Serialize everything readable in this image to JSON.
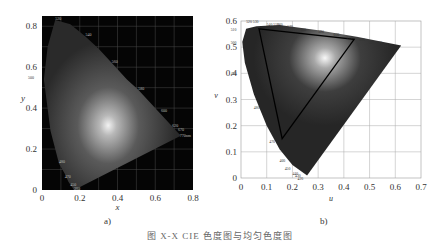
{
  "caption": "图 X-X  CIE 色度图与均匀色度图",
  "chart_data": [
    {
      "type": "scatter",
      "title": "CIE 1931 xy chromaticity diagram",
      "panel_label": "a)",
      "xlabel": "x",
      "ylabel": "y",
      "xlim": [
        0,
        0.8
      ],
      "ylim": [
        0,
        0.85
      ],
      "xticks": [
        "0",
        "0.2",
        "0.4",
        "0.6",
        "0.8"
      ],
      "yticks": [
        "0",
        "0.2",
        "0.4",
        "0.6",
        "0.8"
      ],
      "grid": true,
      "background": "#050505",
      "wavelength_labels": [
        {
          "nm": "520",
          "x": 0.07,
          "y": 0.83
        },
        {
          "nm": "540",
          "x": 0.23,
          "y": 0.75
        },
        {
          "nm": "500",
          "x": 0.01,
          "y": 0.54
        },
        {
          "nm": "560",
          "x": 0.37,
          "y": 0.62
        },
        {
          "nm": "580",
          "x": 0.51,
          "y": 0.49
        },
        {
          "nm": "600",
          "x": 0.63,
          "y": 0.38
        },
        {
          "nm": "620",
          "x": 0.69,
          "y": 0.31
        },
        {
          "nm": "670",
          "x": 0.72,
          "y": 0.29
        },
        {
          "nm": "770nm",
          "x": 0.73,
          "y": 0.26
        },
        {
          "nm": "480",
          "x": 0.09,
          "y": 0.13
        },
        {
          "nm": "470",
          "x": 0.12,
          "y": 0.06
        },
        {
          "nm": "450",
          "x": 0.15,
          "y": 0.02
        },
        {
          "nm": "380",
          "x": 0.17,
          "y": 0.0
        }
      ],
      "locus": [
        [
          0.17,
          0.0
        ],
        [
          0.14,
          0.04
        ],
        [
          0.12,
          0.08
        ],
        [
          0.09,
          0.13
        ],
        [
          0.045,
          0.29
        ],
        [
          0.01,
          0.54
        ],
        [
          0.03,
          0.7
        ],
        [
          0.07,
          0.83
        ],
        [
          0.15,
          0.81
        ],
        [
          0.23,
          0.75
        ],
        [
          0.3,
          0.69
        ],
        [
          0.37,
          0.62
        ],
        [
          0.45,
          0.54
        ],
        [
          0.51,
          0.49
        ],
        [
          0.57,
          0.43
        ],
        [
          0.63,
          0.37
        ],
        [
          0.69,
          0.31
        ],
        [
          0.735,
          0.265
        ]
      ]
    },
    {
      "type": "scatter",
      "title": "CIE 1976 u'v' uniform chromaticity diagram",
      "panel_label": "b)",
      "xlabel": "u",
      "ylabel": "v",
      "xlim": [
        0,
        0.7
      ],
      "ylim": [
        0,
        0.6
      ],
      "xticks": [
        "0",
        "0.1",
        "0.2",
        "0.3",
        "0.4",
        "0.5",
        "0.6",
        "0.7"
      ],
      "yticks": [
        "0",
        "0.1",
        "0.2",
        "0.3",
        "0.4",
        "0.5",
        "0.6"
      ],
      "grid": true,
      "background": "#ffffff",
      "wavelength_labels": [
        {
          "nm": "520 530",
          "u": 0.02,
          "v": 0.6
        },
        {
          "nm": "540 550",
          "u": 0.1,
          "v": 0.59
        },
        {
          "nm": "560",
          "u": 0.14,
          "v": 0.59
        },
        {
          "nm": "570",
          "u": 0.18,
          "v": 0.58
        },
        {
          "nm": "580",
          "u": 0.23,
          "v": 0.57
        },
        {
          "nm": "590",
          "u": 0.3,
          "v": 0.56
        },
        {
          "nm": "600",
          "u": 0.36,
          "v": 0.55
        },
        {
          "nm": "610",
          "u": 0.41,
          "v": 0.54
        },
        {
          "nm": "620",
          "u": 0.46,
          "v": 0.53
        },
        {
          "nm": "630 640",
          "u": 0.5,
          "v": 0.52
        },
        {
          "nm": "650",
          "u": 0.55,
          "v": 0.51
        },
        {
          "nm": "510",
          "u": -0.04,
          "v": 0.57
        },
        {
          "nm": "500",
          "u": -0.04,
          "v": 0.52
        },
        {
          "nm": "490",
          "u": -0.04,
          "v": 0.4
        },
        {
          "nm": "480",
          "u": 0.05,
          "v": 0.27
        },
        {
          "nm": "470",
          "u": 0.11,
          "v": 0.14
        },
        {
          "nm": "460",
          "u": 0.15,
          "v": 0.07
        },
        {
          "nm": "450",
          "u": 0.17,
          "v": 0.04
        },
        {
          "nm": "440",
          "u": 0.2,
          "v": 0.02
        },
        {
          "nm": "430",
          "u": 0.21,
          "v": 0.01
        },
        {
          "nm": "420",
          "u": 0.22,
          "v": 0.0
        }
      ],
      "locus": [
        [
          0.257,
          0.01
        ],
        [
          0.2,
          0.05
        ],
        [
          0.15,
          0.11
        ],
        [
          0.1,
          0.2
        ],
        [
          0.05,
          0.32
        ],
        [
          0.015,
          0.44
        ],
        [
          0.005,
          0.52
        ],
        [
          0.02,
          0.57
        ],
        [
          0.06,
          0.58
        ],
        [
          0.15,
          0.585
        ],
        [
          0.3,
          0.565
        ],
        [
          0.45,
          0.54
        ],
        [
          0.623,
          0.506
        ]
      ],
      "gamut_triangle": [
        [
          0.07,
          0.57
        ],
        [
          0.44,
          0.53
        ],
        [
          0.16,
          0.15
        ]
      ]
    }
  ]
}
